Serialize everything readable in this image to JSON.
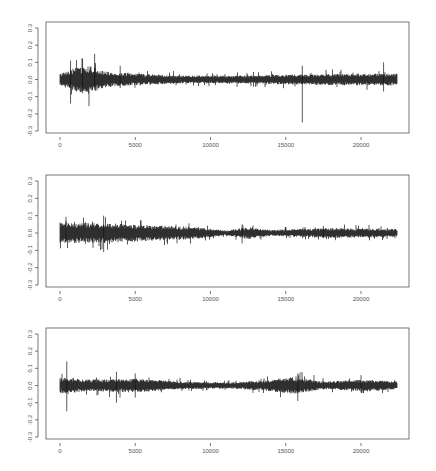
{
  "chart_data": [
    {
      "type": "line",
      "title": "",
      "xlabel": "",
      "ylabel": "",
      "xlim": [
        0,
        22500
      ],
      "ylim": [
        -0.3,
        0.3
      ],
      "grid": false,
      "x_ticks": [
        0,
        5000,
        10000,
        15000,
        20000
      ],
      "x_tick_labels": [
        "0",
        "5000",
        "10000",
        "15000",
        "20000"
      ],
      "y_ticks": [
        0.3,
        0.2,
        0.1,
        0.0,
        -0.1,
        -0.2,
        -0.3
      ],
      "y_tick_labels": [
        "0.3",
        "0.2",
        "0.1",
        "0.0",
        "-0.1",
        "-0.2",
        "-0.3"
      ],
      "series": [
        {
          "name": "series-1",
          "n_points": 22400,
          "baseline": 0.0,
          "envelope": [
            {
              "x": 0,
              "amp": 0.03
            },
            {
              "x": 1000,
              "amp": 0.06
            },
            {
              "x": 2000,
              "amp": 0.07
            },
            {
              "x": 3000,
              "amp": 0.04
            },
            {
              "x": 5000,
              "amp": 0.03
            },
            {
              "x": 8000,
              "amp": 0.02
            },
            {
              "x": 12000,
              "amp": 0.02
            },
            {
              "x": 15000,
              "amp": 0.025
            },
            {
              "x": 19000,
              "amp": 0.03
            },
            {
              "x": 22400,
              "amp": 0.03
            }
          ],
          "spikes": [
            {
              "x": 700,
              "min": -0.14,
              "max": 0.11
            },
            {
              "x": 1500,
              "min": -0.08,
              "max": 0.12
            },
            {
              "x": 2300,
              "min": -0.06,
              "max": 0.15
            },
            {
              "x": 4000,
              "min": -0.05,
              "max": 0.08
            },
            {
              "x": 16100,
              "min": -0.25,
              "max": 0.08
            },
            {
              "x": 21500,
              "min": -0.07,
              "max": 0.1
            }
          ]
        }
      ]
    },
    {
      "type": "line",
      "title": "",
      "xlabel": "",
      "ylabel": "",
      "xlim": [
        0,
        22500
      ],
      "ylim": [
        -0.3,
        0.3
      ],
      "grid": false,
      "x_ticks": [
        0,
        5000,
        10000,
        15000,
        20000
      ],
      "x_tick_labels": [
        "0",
        "5000",
        "10000",
        "15000",
        "20000"
      ],
      "y_ticks": [
        0.3,
        0.2,
        0.1,
        0.0,
        -0.1,
        -0.2,
        -0.3
      ],
      "y_tick_labels": [
        "0.3",
        "0.2",
        "0.1",
        "0.0",
        "-0.1",
        "-0.2",
        "-0.3"
      ],
      "series": [
        {
          "name": "series-2",
          "n_points": 22400,
          "baseline": 0.0,
          "envelope": [
            {
              "x": 0,
              "amp": 0.05
            },
            {
              "x": 3000,
              "amp": 0.05
            },
            {
              "x": 6000,
              "amp": 0.04
            },
            {
              "x": 9000,
              "amp": 0.03
            },
            {
              "x": 11000,
              "amp": 0.012
            },
            {
              "x": 12500,
              "amp": 0.03
            },
            {
              "x": 14000,
              "amp": 0.015
            },
            {
              "x": 18000,
              "amp": 0.025
            },
            {
              "x": 22400,
              "amp": 0.02
            }
          ],
          "spikes": [
            {
              "x": 400,
              "min": -0.05,
              "max": 0.07
            },
            {
              "x": 2900,
              "min": -0.11,
              "max": 0.1
            },
            {
              "x": 12100,
              "min": -0.06,
              "max": 0.05
            },
            {
              "x": 17500,
              "min": -0.03,
              "max": 0.04
            }
          ]
        }
      ]
    },
    {
      "type": "line",
      "title": "",
      "xlabel": "",
      "ylabel": "",
      "xlim": [
        0,
        22500
      ],
      "ylim": [
        -0.3,
        0.3
      ],
      "grid": false,
      "x_ticks": [
        0,
        5000,
        10000,
        15000,
        20000
      ],
      "x_tick_labels": [
        "0",
        "5000",
        "10000",
        "15000",
        "20000"
      ],
      "y_ticks": [
        0.3,
        0.2,
        0.1,
        0.0,
        -0.1,
        -0.2,
        -0.3
      ],
      "y_tick_labels": [
        "0.3",
        "0.2",
        "0.1",
        "0.0",
        "-0.1",
        "-0.2",
        "-0.3"
      ],
      "series": [
        {
          "name": "series-3",
          "n_points": 22400,
          "baseline": 0.0,
          "envelope": [
            {
              "x": 0,
              "amp": 0.04
            },
            {
              "x": 2000,
              "amp": 0.03
            },
            {
              "x": 5000,
              "amp": 0.035
            },
            {
              "x": 8000,
              "amp": 0.02
            },
            {
              "x": 11000,
              "amp": 0.015
            },
            {
              "x": 13500,
              "amp": 0.025
            },
            {
              "x": 15500,
              "amp": 0.045
            },
            {
              "x": 17500,
              "amp": 0.02
            },
            {
              "x": 20500,
              "amp": 0.03
            },
            {
              "x": 22400,
              "amp": 0.02
            }
          ],
          "spikes": [
            {
              "x": 450,
              "min": -0.15,
              "max": 0.14
            },
            {
              "x": 3750,
              "min": -0.1,
              "max": 0.08
            },
            {
              "x": 5000,
              "min": -0.07,
              "max": 0.07
            },
            {
              "x": 15800,
              "min": -0.09,
              "max": 0.07
            },
            {
              "x": 20000,
              "min": -0.04,
              "max": 0.06
            }
          ]
        }
      ]
    }
  ]
}
